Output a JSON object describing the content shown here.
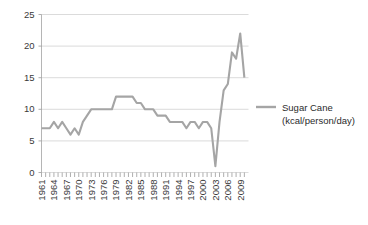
{
  "chart_data": {
    "type": "line",
    "title": "",
    "xlabel": "",
    "ylabel": "",
    "xlim": [
      1961,
      2011
    ],
    "ylim": [
      0,
      25
    ],
    "ytick_step": 5,
    "grid": true,
    "legend_position": "right",
    "line_color": "#a5a5a5",
    "yticks": [
      "0",
      "5",
      "10",
      "15",
      "20",
      "25"
    ],
    "ytick_values": [
      0,
      5,
      10,
      15,
      20,
      25
    ],
    "xticks": [
      "1961",
      "1964",
      "1967",
      "1970",
      "1973",
      "1976",
      "1979",
      "1982",
      "1985",
      "1988",
      "1991",
      "1994",
      "1997",
      "2000",
      "2003",
      "2006",
      "2009"
    ],
    "xtick_values": [
      1961,
      1964,
      1967,
      1970,
      1973,
      1976,
      1979,
      1982,
      1985,
      1988,
      1991,
      1994,
      1997,
      2000,
      2003,
      2006,
      2009
    ],
    "series": [
      {
        "name": "Sugar Cane",
        "unit": "(kcal/person/day)",
        "color": "#a5a5a5",
        "x": [
          1961,
          1962,
          1963,
          1964,
          1965,
          1966,
          1967,
          1968,
          1969,
          1970,
          1971,
          1972,
          1973,
          1974,
          1975,
          1976,
          1977,
          1978,
          1979,
          1980,
          1981,
          1982,
          1983,
          1984,
          1985,
          1986,
          1987,
          1988,
          1989,
          1990,
          1991,
          1992,
          1993,
          1994,
          1995,
          1996,
          1997,
          1998,
          1999,
          2000,
          2001,
          2002,
          2003,
          2004,
          2005,
          2006,
          2007,
          2008,
          2009,
          2010
        ],
        "values": [
          7,
          7,
          7,
          8,
          7,
          8,
          7,
          6,
          7,
          6,
          8,
          9,
          10,
          10,
          10,
          10,
          10,
          10,
          12,
          12,
          12,
          12,
          12,
          11,
          11,
          10,
          10,
          10,
          9,
          9,
          9,
          8,
          8,
          8,
          8,
          7,
          8,
          8,
          7,
          8,
          8,
          7,
          1,
          8,
          13,
          14,
          19,
          18,
          22,
          15
        ]
      }
    ],
    "legend": [
      {
        "label": "Sugar Cane",
        "sublabel": "(kcal/person/day)",
        "color": "#a5a5a5"
      }
    ]
  }
}
